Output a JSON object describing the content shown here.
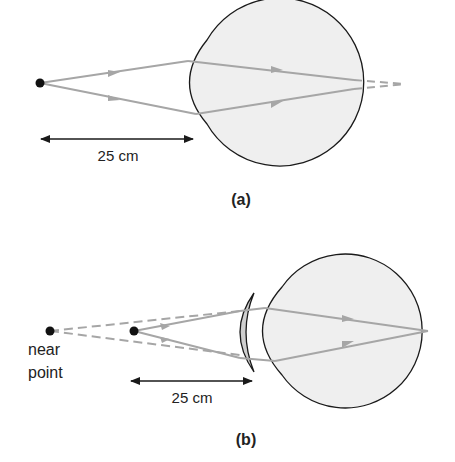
{
  "colors": {
    "eye_fill": "#efefef",
    "outline": "#1a1a1a",
    "ray": "#a6a6a6",
    "lens_fill": "#cfcfcf",
    "text": "#222222"
  },
  "panel_a": {
    "caption": "(a)",
    "distance_label": "25 cm"
  },
  "panel_b": {
    "caption": "(b)",
    "distance_label": "25 cm",
    "near_point_label_line1": "near",
    "near_point_label_line2": "point"
  }
}
